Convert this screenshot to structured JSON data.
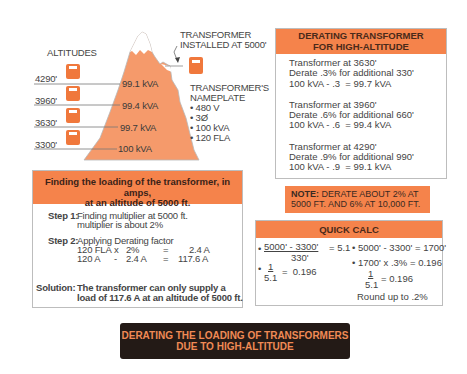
{
  "diagram": {
    "altitudes_label": "ALTITUDES",
    "altitudes": [
      {
        "alt": "4290'",
        "kva": "99.1 kVA"
      },
      {
        "alt": "3960'",
        "kva": "99.4 kVA"
      },
      {
        "alt": "3630'",
        "kva": "99.7 kVA"
      },
      {
        "alt": "3300'",
        "kva": "100 kVA"
      }
    ],
    "installed_label_line1": "TRANSFORMER",
    "installed_label_line2": "INSTALLED AT 5000'",
    "nameplate": {
      "title_line1": "TRANSFORMER'S",
      "title_line2": "NAMEPLATE",
      "items": [
        "• 480 V",
        "• 3Ø",
        "• 100 kVA",
        "• 120 FLA"
      ]
    },
    "colors": {
      "accent": "#f5834b",
      "mountain": "#f59a6b",
      "banner_bg": "#231a16",
      "banner_text": "#f08a55"
    }
  },
  "derating_box": {
    "title_line1": "DERATING TRANSFORMER",
    "title_line2": "FOR HIGH-ALTITUDE",
    "groups": [
      {
        "l1": "Transformer at 3630'",
        "l2": "Derate .3% for additional 330'",
        "l3": "100 kVA - .3  = 99.7 kVA"
      },
      {
        "l1": "Transformer at 3960'",
        "l2": "Derate .6% for additional 660'",
        "l3": "100 kVA - .6  = 99.4 kVA"
      },
      {
        "l1": "Transformer at 4290'",
        "l2": "Derate .9% for additional 990'",
        "l3": "100 kVA - .9  = 99.1 kVA"
      }
    ]
  },
  "note": {
    "prefix": "NOTE:",
    "line1": " DERATE ABOUT 2% AT",
    "line2": "5000 FT. AND 6% AT 10,000 FT."
  },
  "quick_calc": {
    "title": "QUICK CALC",
    "left": {
      "num1": "5000' - 3300'",
      "eq1": "= 5.1",
      "den1": "330'",
      "num2": "1",
      "den2": "5.1",
      "eq2": "=  0.196"
    },
    "right": {
      "line1": "• 5000' - 3300' = 1700'",
      "line2": "• 1700' x .3% = 0.196",
      "num": "1",
      "den": "5.1",
      "eq": "= 0.196",
      "round": "Round up to .2%"
    }
  },
  "steps_box": {
    "title_line1": "Finding the loading of the transformer, in amps,",
    "title_line2": "at an altitude of 5000 ft.",
    "step1_label": "Step 1:",
    "step1_l1": "Finding multiplier at 5000 ft.",
    "step1_l2": "multiplier is about 2%",
    "step2_label": "Step 2:",
    "step2_l1": "Applying Derating factor",
    "calc_rows": [
      {
        "a": "120 FLA",
        "op": "x",
        "b": "2%",
        "eq": "=",
        "r": "2.4 A"
      },
      {
        "a": "120 A",
        "op": "-",
        "b": "2.4 A",
        "eq": "=",
        "r": "117.6 A"
      }
    ],
    "solution_label": "Solution:",
    "solution_l1": "The transformer can only supply a",
    "solution_l2": "load of 117.6 A at an altitude of 5000 ft."
  },
  "banner": {
    "line1": "DERATING THE LOADING OF TRANSFORMERS",
    "line2": "DUE TO HIGH-ALTITUDE"
  }
}
